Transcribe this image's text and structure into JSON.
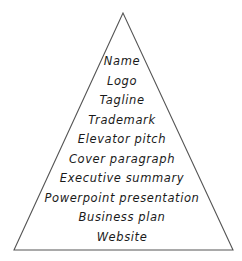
{
  "diagram": {
    "type": "pyramid",
    "stroke_color": "#555555",
    "levels": [
      {
        "label": "Name"
      },
      {
        "label": "Logo"
      },
      {
        "label": "Tagline"
      },
      {
        "label": "Trademark"
      },
      {
        "label": "Elevator pitch"
      },
      {
        "label": "Cover paragraph"
      },
      {
        "label": "Executive summary"
      },
      {
        "label": "Powerpoint presentation"
      },
      {
        "label": "Business plan"
      },
      {
        "label": "Website"
      }
    ]
  }
}
